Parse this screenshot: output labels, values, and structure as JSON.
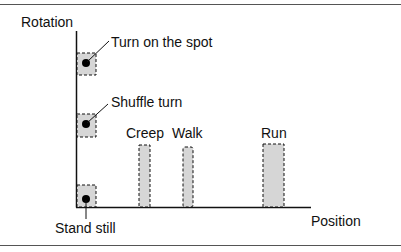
{
  "diagram": {
    "y_axis_label": "Rotation",
    "x_axis_label": "Position",
    "annotations": {
      "turn_on_spot": "Turn on the spot",
      "shuffle_turn": "Shuffle turn",
      "stand_still": "Stand still",
      "creep": "Creep",
      "walk": "Walk",
      "run": "Run"
    },
    "colors": {
      "fill": "#d6d6d6",
      "line": "#111111"
    }
  }
}
